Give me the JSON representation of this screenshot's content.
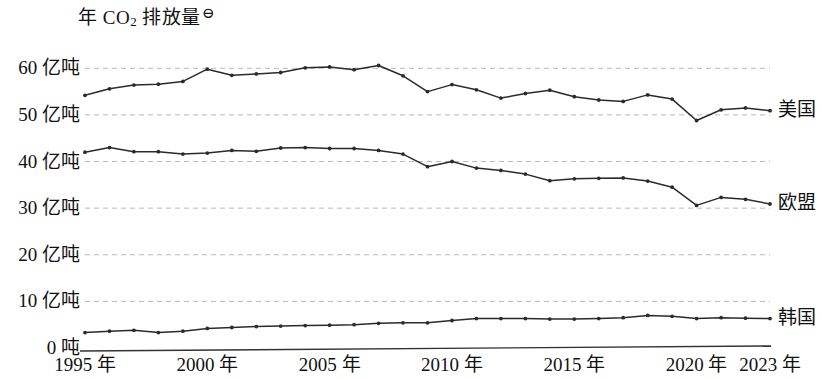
{
  "chart_data": {
    "type": "line",
    "title_main": "年 CO",
    "title_sub": "2",
    "title_tail": " 排放量",
    "title_footnote_mark": "⊖",
    "xlabel": "",
    "ylabel": "",
    "grid": true,
    "legend_position": "right-inline",
    "xlim": [
      1995,
      2023
    ],
    "ylim": [
      0,
      65
    ],
    "y_ticks": [
      0,
      10,
      20,
      30,
      40,
      50,
      60
    ],
    "y_tick_labels": [
      "0 吨",
      "10 亿吨",
      "20 亿吨",
      "30 亿吨",
      "40 亿吨",
      "50 亿吨",
      "60 亿吨"
    ],
    "x_ticks": [
      1995,
      2000,
      2005,
      2010,
      2015,
      2020,
      2023
    ],
    "x_tick_labels": [
      "1995 年",
      "2000 年",
      "2005 年",
      "2010 年",
      "2015 年",
      "2020 年",
      "2023 年"
    ],
    "unit_note": "单位：亿吨",
    "x": [
      1995,
      1996,
      1997,
      1998,
      1999,
      2000,
      2001,
      2002,
      2003,
      2004,
      2005,
      2006,
      2007,
      2008,
      2009,
      2010,
      2011,
      2012,
      2013,
      2014,
      2015,
      2016,
      2017,
      2018,
      2019,
      2020,
      2021,
      2022,
      2023
    ],
    "series": [
      {
        "name": "美国",
        "color": "#2b2b2b",
        "values": [
          54.2,
          55.6,
          56.4,
          56.6,
          57.2,
          59.8,
          58.5,
          58.8,
          59.1,
          60.1,
          60.3,
          59.7,
          60.6,
          58.4,
          55.0,
          56.5,
          55.4,
          53.6,
          54.6,
          55.3,
          53.9,
          53.2,
          52.9,
          54.3,
          53.4,
          48.8,
          51.1,
          51.5,
          50.9
        ]
      },
      {
        "name": "欧盟",
        "color": "#2b2b2b",
        "values": [
          42.0,
          43.0,
          42.1,
          42.1,
          41.6,
          41.8,
          42.4,
          42.2,
          42.9,
          43.0,
          42.8,
          42.8,
          42.4,
          41.6,
          38.9,
          40.0,
          38.6,
          38.1,
          37.3,
          35.9,
          36.3,
          36.4,
          36.5,
          35.8,
          34.5,
          30.6,
          32.3,
          31.9,
          30.9
        ]
      },
      {
        "name": "韩国",
        "color": "#2b2b2b",
        "values": [
          3.3,
          3.6,
          3.8,
          3.3,
          3.6,
          4.2,
          4.4,
          4.6,
          4.7,
          4.8,
          4.9,
          5.0,
          5.3,
          5.4,
          5.4,
          5.9,
          6.3,
          6.3,
          6.3,
          6.2,
          6.2,
          6.3,
          6.5,
          7.0,
          6.8,
          6.3,
          6.5,
          6.4,
          6.3
        ]
      }
    ]
  },
  "axes": {
    "baseline_name": "x-axis-line"
  }
}
